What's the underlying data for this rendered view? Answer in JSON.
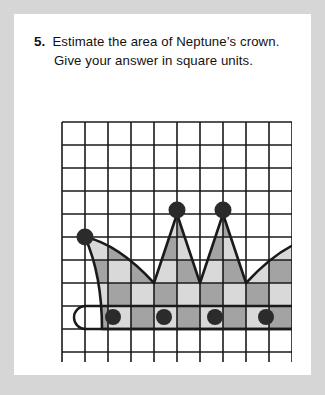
{
  "page": {
    "background_color": "#d6d6d6",
    "card_color": "#ffffff"
  },
  "question": {
    "number": "5.",
    "line1": "Estimate the area of Neptune’s crown.",
    "line2": "Give your answer in square units."
  },
  "figure": {
    "name": "neptunes-crown-on-grid",
    "grid": {
      "columns": 10,
      "rows": 11,
      "cell_size": 23,
      "origin_x": 29,
      "origin_y": 30,
      "line_color": "#1a1a1a",
      "line_width": 1.6
    },
    "colors": {
      "light_fill": "#d9d9d9",
      "dark_fill": "#a3a3a3",
      "outline": "#1a1a1a",
      "jewel": "#2b2b2b"
    },
    "crown": {
      "description": "Crown with two inner spikes, two outer curved points, checkerboard shading, and a jeweled base band",
      "outline_path": "M 52,145 C 75,150 98,166 121,191 L 144,122 L 167,191 L 190,122 L 213,191 C 236,166 259,150 282,145 C 271,170 265,200 265,237 L 69,237 C 69,200 63,170 52,145 Z",
      "checker_clip_columns": 10,
      "finials": [
        {
          "name": "left-point-ball",
          "cx": 52,
          "cy": 145,
          "r": 8.5
        },
        {
          "name": "inner-left-ball",
          "cx": 144,
          "cy": 118,
          "r": 8.5
        },
        {
          "name": "inner-right-ball",
          "cx": 190,
          "cy": 118,
          "r": 8.5
        },
        {
          "name": "right-point-ball",
          "cx": 282,
          "cy": 145,
          "r": 8.5
        }
      ],
      "base_band": {
        "x": 41,
        "y": 214,
        "width": 252,
        "height": 23,
        "radius": 11.5
      },
      "base_jewels": [
        {
          "name": "base-jewel-1",
          "cx": 80,
          "cy": 225,
          "r": 8
        },
        {
          "name": "base-jewel-2",
          "cx": 131,
          "cy": 225,
          "r": 8
        },
        {
          "name": "base-jewel-3",
          "cx": 182,
          "cy": 225,
          "r": 8
        },
        {
          "name": "base-jewel-4",
          "cx": 233,
          "cy": 225,
          "r": 8
        }
      ]
    }
  }
}
